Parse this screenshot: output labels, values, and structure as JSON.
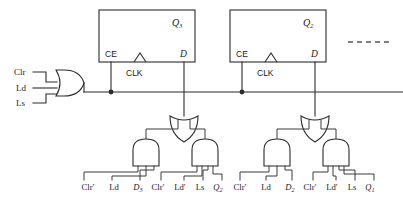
{
  "diagram": {
    "type": "logic-circuit-schematic",
    "colors": {
      "background": "#ffffff",
      "wire": "#2b2b2b",
      "text": "#1a1a1a",
      "dashed_continuation": "#555555"
    },
    "control_inputs": [
      {
        "name": "clr",
        "label": "Clr"
      },
      {
        "name": "ld",
        "label": "Ld"
      },
      {
        "name": "ls",
        "label": "Ls"
      }
    ],
    "enable_gate": {
      "name": "ce-or-gate",
      "type": "OR",
      "inputs": 3,
      "output_net": "CE bus"
    },
    "flipflops": [
      {
        "name": "ff-q3",
        "q_label": "Q",
        "q_sub": "3",
        "ce_label": "CE",
        "d_label": "D",
        "clk_label": "CLK"
      },
      {
        "name": "ff-q2",
        "q_label": "Q",
        "q_sub": "2",
        "ce_label": "CE",
        "d_label": "D",
        "clk_label": "CLK"
      }
    ],
    "continuation": {
      "name": "ellipsis-dashes",
      "style": "dashed-line"
    },
    "logic_blocks": [
      {
        "name": "d3-logic",
        "or_gate": {
          "name": "d3-or-gate",
          "type": "OR",
          "inputs": 2
        },
        "and_gates": [
          {
            "name": "d3-and-gate-load",
            "type": "AND",
            "inputs": 3,
            "terms": [
              {
                "text": "Clr",
                "prime": true,
                "italic": false,
                "sub": ""
              },
              {
                "text": "Ld",
                "prime": false,
                "italic": false,
                "sub": ""
              },
              {
                "text": "D",
                "prime": false,
                "italic": true,
                "sub": "3"
              }
            ]
          },
          {
            "name": "d3-and-gate-shift",
            "type": "AND",
            "inputs": 4,
            "terms": [
              {
                "text": "Clr",
                "prime": true,
                "italic": false,
                "sub": ""
              },
              {
                "text": "Ld",
                "prime": true,
                "italic": false,
                "sub": ""
              },
              {
                "text": "Ls",
                "prime": false,
                "italic": false,
                "sub": ""
              },
              {
                "text": "Q",
                "prime": false,
                "italic": true,
                "sub": "2"
              }
            ]
          }
        ]
      },
      {
        "name": "d2-logic",
        "or_gate": {
          "name": "d2-or-gate",
          "type": "OR",
          "inputs": 2
        },
        "and_gates": [
          {
            "name": "d2-and-gate-load",
            "type": "AND",
            "inputs": 3,
            "terms": [
              {
                "text": "Clr",
                "prime": true,
                "italic": false,
                "sub": ""
              },
              {
                "text": "Ld",
                "prime": false,
                "italic": false,
                "sub": ""
              },
              {
                "text": "D",
                "prime": false,
                "italic": true,
                "sub": "2"
              }
            ]
          },
          {
            "name": "d2-and-gate-shift",
            "type": "AND",
            "inputs": 4,
            "terms": [
              {
                "text": "Clr",
                "prime": true,
                "italic": false,
                "sub": ""
              },
              {
                "text": "Ld",
                "prime": true,
                "italic": false,
                "sub": ""
              },
              {
                "text": "Ls",
                "prime": false,
                "italic": false,
                "sub": ""
              },
              {
                "text": "Q",
                "prime": false,
                "italic": true,
                "sub": "1"
              }
            ]
          }
        ]
      }
    ],
    "terminal_labels": [
      {
        "name": "term-clr-n-1",
        "text": "Clr",
        "prime": true,
        "italic": false,
        "sub": "",
        "x": 88,
        "y": 190
      },
      {
        "name": "term-ld-1",
        "text": "Ld",
        "prime": false,
        "italic": false,
        "sub": "",
        "x": 114,
        "y": 190
      },
      {
        "name": "term-d3",
        "text": "D",
        "prime": false,
        "italic": true,
        "sub": "3",
        "x": 138,
        "y": 190
      },
      {
        "name": "term-clr-n-2",
        "text": "Clr",
        "prime": true,
        "italic": false,
        "sub": "",
        "x": 158,
        "y": 190
      },
      {
        "name": "term-ld-n-1",
        "text": "Ld",
        "prime": true,
        "italic": false,
        "sub": "",
        "x": 180,
        "y": 190
      },
      {
        "name": "term-ls-1",
        "text": "Ls",
        "prime": false,
        "italic": false,
        "sub": "",
        "x": 200,
        "y": 190
      },
      {
        "name": "term-q2",
        "text": "Q",
        "prime": false,
        "italic": true,
        "sub": "2",
        "x": 218,
        "y": 190
      },
      {
        "name": "term-clr-n-3",
        "text": "Clr",
        "prime": true,
        "italic": false,
        "sub": "",
        "x": 240,
        "y": 190
      },
      {
        "name": "term-ld-2",
        "text": "Ld",
        "prime": false,
        "italic": false,
        "sub": "",
        "x": 266,
        "y": 190
      },
      {
        "name": "term-d2",
        "text": "D",
        "prime": false,
        "italic": true,
        "sub": "2",
        "x": 290,
        "y": 190
      },
      {
        "name": "term-clr-n-4",
        "text": "Clr",
        "prime": true,
        "italic": false,
        "sub": "",
        "x": 310,
        "y": 190
      },
      {
        "name": "term-ld-n-2",
        "text": "Ld",
        "prime": true,
        "italic": false,
        "sub": "",
        "x": 332,
        "y": 190
      },
      {
        "name": "term-ls-2",
        "text": "Ls",
        "prime": false,
        "italic": false,
        "sub": "",
        "x": 352,
        "y": 190
      },
      {
        "name": "term-q1",
        "text": "Q",
        "prime": false,
        "italic": true,
        "sub": "1",
        "x": 370,
        "y": 190
      }
    ]
  }
}
